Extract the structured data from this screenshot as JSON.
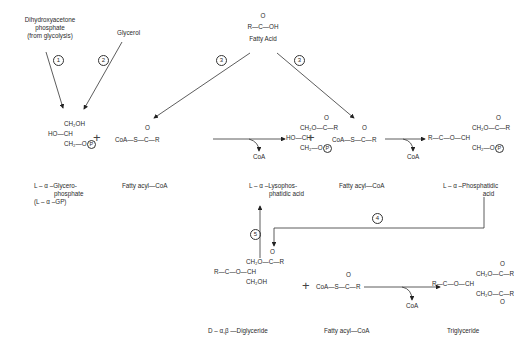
{
  "sources": {
    "dhap": [
      "Dihydroxyacetone",
      "phosphate",
      "(from glycolysis)"
    ],
    "glycerol": "Glycerol",
    "fatty_acid": {
      "carbonyl_o": "O",
      "formula": "R—C—OH",
      "label": "Fatty Acid"
    }
  },
  "steps": [
    "1",
    "2",
    "3",
    "3",
    "4",
    "5"
  ],
  "molecules": {
    "glycerophosphate": {
      "lines": [
        "CH₂OH",
        "HO—CH",
        "CH₂—O"
      ],
      "phosphate": "P",
      "label": [
        "L – α –Glycero-",
        "phosphate",
        "(L – α –GP)"
      ]
    },
    "fatty_acyl_coa_1": {
      "o": "O",
      "formula": "CoA—S—C—R",
      "label": "Fatty acyl—CoA"
    },
    "lysophosphatidic_acid": {
      "o": "O",
      "lines": [
        "CH₂O—C—R",
        "HO—CH",
        "CH₂—O"
      ],
      "phosphate": "P",
      "label": [
        "L – α –Lysophos-",
        "phatidic acid"
      ]
    },
    "fatty_acyl_coa_2": {
      "o": "O",
      "formula": "CoA—S—C—R",
      "label": "Fatty acyl—CoA"
    },
    "phosphatidic_acid": {
      "o": "O",
      "lines": [
        "CH₂O—C—R",
        "R—C—O—CH",
        "CH₂—O"
      ],
      "phosphate": "P",
      "label": [
        "L – α –Phosphatidic",
        "acid"
      ]
    },
    "diglyceride": {
      "o": "O",
      "lines": [
        "CH₂O—C—R",
        "R—C—O—CH",
        "CH₂OH"
      ],
      "label": "D – α,β —Diglyceride"
    },
    "fatty_acyl_coa_3": {
      "o": "O",
      "formula": "CoA—S—C—R",
      "label": "Fatty acyl—CoA"
    },
    "triglyceride": {
      "o": "O",
      "lines": [
        "CH₂O—C—R",
        "R—C—O—CH",
        "CH₂O—C—R"
      ],
      "label": "Triglyceride"
    }
  },
  "byproducts": {
    "coa_1": "CoA",
    "coa_2": "CoA",
    "coa_3": "CoA"
  },
  "plus": "+"
}
